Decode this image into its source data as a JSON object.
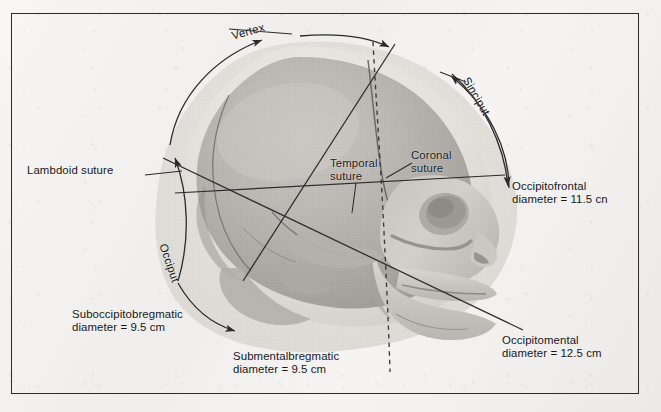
{
  "figure": {
    "domain": "anatomical-diagram",
    "frame_color": "#2c2c2c",
    "background_color": "#f4f3f1",
    "line_color": "#2b2b2b"
  },
  "arc_labels": {
    "vertex": "Vertex",
    "sinciput": "Sinciput",
    "occiput": "Occiput"
  },
  "suture_labels": {
    "lambdoid": "Lambdoid suture",
    "temporal": "Temporal\nsuture",
    "coronal": "Coronal\nsuture"
  },
  "diameters": [
    {
      "name": "occipitofrontal",
      "label": "Occipitofrontal\ndiameter = 11.5 cn",
      "value_cm": 11.5
    },
    {
      "name": "occipitomental",
      "label": "Occipitomental\ndiameter = 12.5 cm",
      "value_cm": 12.5
    },
    {
      "name": "suboccipitobregmatic",
      "label": "Suboccipitobregmatic\ndiameter = 9.5 cm",
      "value_cm": 9.5
    },
    {
      "name": "submentalbregmatic",
      "label": "Submentalbregmatic\ndiameter = 9.5 cm",
      "value_cm": 9.5
    }
  ]
}
